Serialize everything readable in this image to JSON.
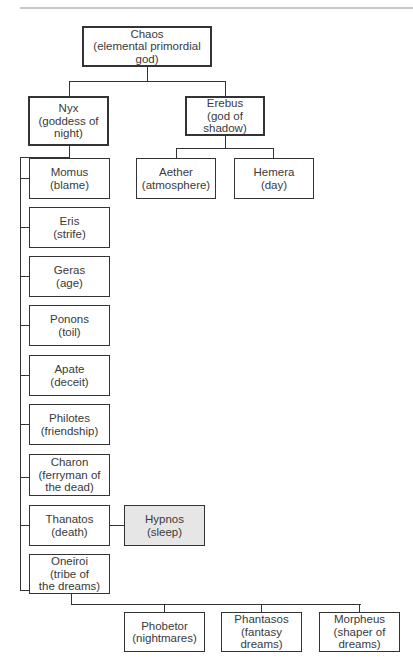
{
  "nodes": {
    "chaos": {
      "label": "Chaos\n(elemental primordial god)"
    },
    "nyx": {
      "label": "Nyx\n(goddess of\nnight)"
    },
    "erebus": {
      "label": "Erebus\n(god of shadow)"
    },
    "aether": {
      "label": "Aether\n(atmosphere)"
    },
    "hemera": {
      "label": "Hemera\n(day)"
    },
    "momus": {
      "label": "Momus\n(blame)"
    },
    "eris": {
      "label": "Eris\n(strife)"
    },
    "geras": {
      "label": "Geras\n(age)"
    },
    "ponons": {
      "label": "Ponons\n(toil)"
    },
    "apate": {
      "label": "Apate\n(deceit)"
    },
    "philotes": {
      "label": "Philotes\n(friendship)"
    },
    "charon": {
      "label": "Charon\n(ferryman of\nthe dead)"
    },
    "thanatos": {
      "label": "Thanatos\n(death)"
    },
    "hypnos": {
      "label": "Hypnos\n(sleep)"
    },
    "oneiroi": {
      "label": "Oneiroi\n(tribe of\nthe dreams)"
    },
    "phobetor": {
      "label": "Phobetor\n(nightmares)"
    },
    "phantasos": {
      "label": "Phantasos\n(fantasy dreams)"
    },
    "morpheus": {
      "label": "Morpheus\n(shaper of\ndreams)"
    }
  },
  "colors": {
    "line": "#333333",
    "highlight_fill": "#e6e6e6"
  }
}
